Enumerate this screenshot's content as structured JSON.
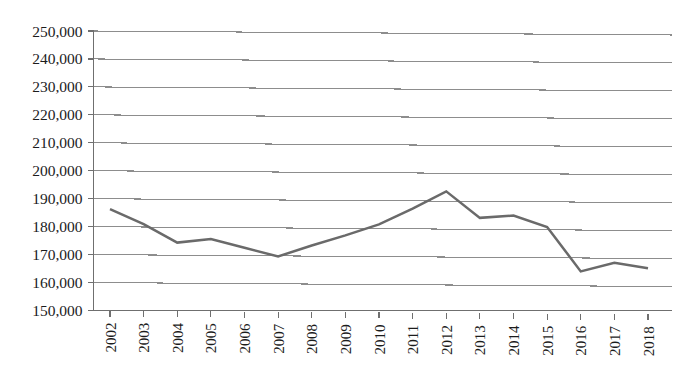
{
  "chart_data": {
    "type": "line",
    "title": "",
    "subtitle": "",
    "xlabel": "",
    "ylabel": "",
    "categories": [
      "2002",
      "2003",
      "2004",
      "2005",
      "2006",
      "2007",
      "2008",
      "2009",
      "2010",
      "2011",
      "2012",
      "2013",
      "2014",
      "2015",
      "2016",
      "2017",
      "2018"
    ],
    "values": [
      186300,
      181000,
      174500,
      175900,
      172800,
      169800,
      173800,
      177500,
      181500,
      187200,
      193500,
      184100,
      185000,
      181000,
      165200,
      168400,
      166500
    ],
    "series": [
      {
        "name": "series-1",
        "values": [
          186300,
          181000,
          174500,
          175900,
          172800,
          169800,
          173800,
          177500,
          181500,
          187200,
          193500,
          184100,
          185000,
          181000,
          165200,
          168400,
          166500
        ]
      }
    ],
    "ylim": [
      150000,
      250000
    ],
    "ytick_step": 10000,
    "ytick_labels": [
      "250,000",
      "240,000",
      "230,000",
      "220,000",
      "210,000",
      "200,000",
      "190,000",
      "180,000",
      "170,000",
      "160,000",
      "150,000"
    ],
    "ytick_values": [
      250000,
      240000,
      230000,
      220000,
      210000,
      200000,
      190000,
      180000,
      170000,
      160000,
      150000
    ],
    "xtick_labels": [
      "2002",
      "2003",
      "2004",
      "2005",
      "2006",
      "2007",
      "2008",
      "2009",
      "2010",
      "2011",
      "2012",
      "2013",
      "2014",
      "2015",
      "2016",
      "2017",
      "2018"
    ],
    "grid": true,
    "grid_axis": "y",
    "legend": false,
    "legend_position": "none",
    "line_color": "#6a6a6a",
    "grid_color": "#8d8d8d",
    "axis_color": "#6f6f6f",
    "text_color": "#1c1c1c",
    "background_color": "#ffffff",
    "xtick_label_rotation": -90,
    "annotations": []
  }
}
